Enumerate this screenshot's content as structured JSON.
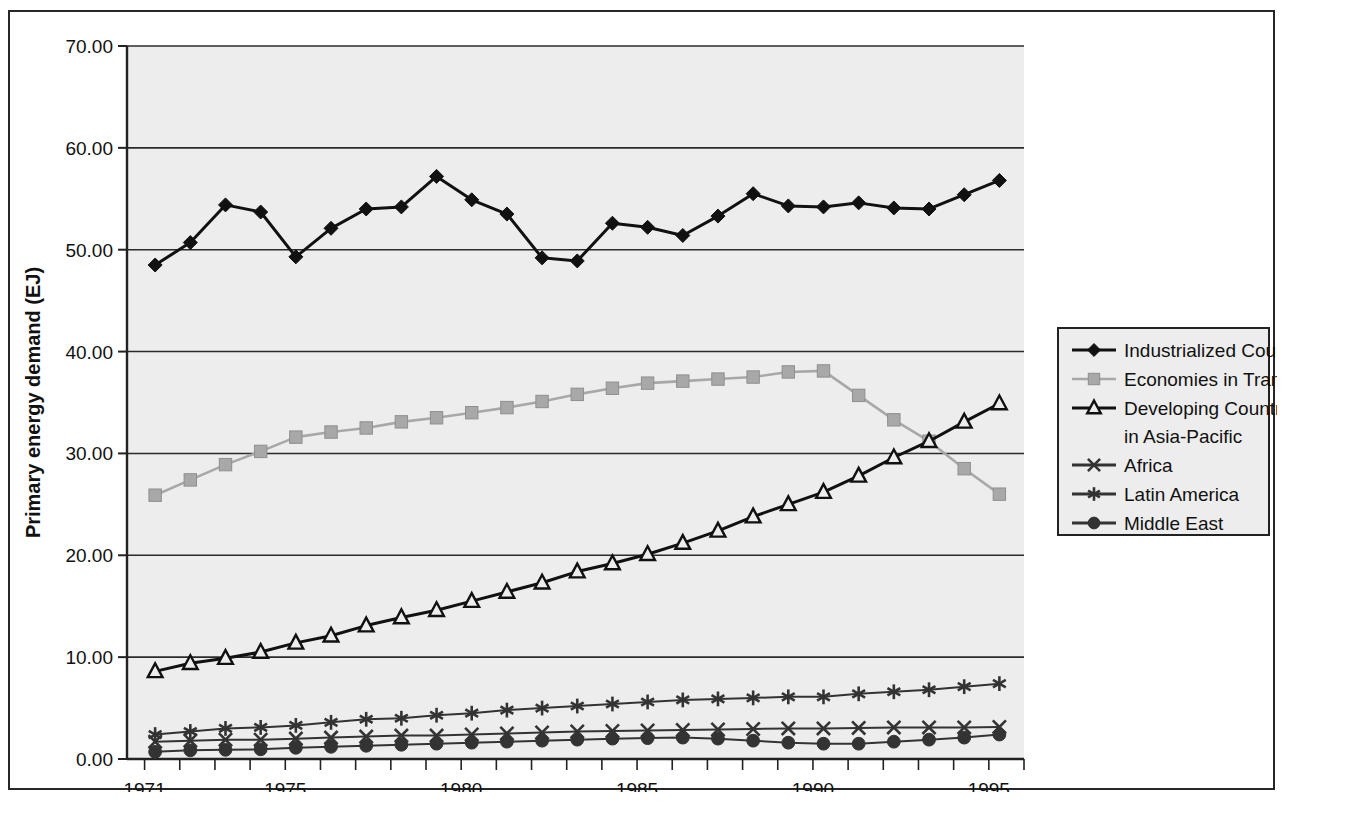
{
  "chart_data": {
    "type": "line",
    "title": "",
    "xlabel": "",
    "ylabel": "Primary energy demand (EJ)",
    "xlim": [
      1970.5,
      1996.0
    ],
    "ylim": [
      0,
      70
    ],
    "ytick_labels": [
      "0.00",
      "10.00",
      "20.00",
      "30.00",
      "40.00",
      "50.00",
      "60.00",
      "70.00"
    ],
    "ytick_values": [
      0,
      10,
      20,
      30,
      40,
      50,
      60,
      70
    ],
    "xtick_labels": [
      "1971",
      "1975",
      "1980",
      "1985",
      "1990",
      "1995"
    ],
    "xtick_values": [
      1971,
      1975,
      1980,
      1985,
      1990,
      1995
    ],
    "x_minor_ticks_every": 1,
    "grid": "horizontal",
    "legend_position": "right-outside",
    "plot_background": "#ededed",
    "x": [
      1971.3,
      1972.3,
      1973.3,
      1974.3,
      1975.3,
      1976.3,
      1977.3,
      1978.3,
      1979.3,
      1980.3,
      1981.3,
      1982.3,
      1983.3,
      1984.3,
      1985.3,
      1986.3,
      1987.3,
      1988.3,
      1989.3,
      1990.3,
      1991.3,
      1992.3,
      1993.3,
      1994.3,
      1995.3
    ],
    "series": [
      {
        "name": "Industrialized Countries",
        "marker": "filled-diamond",
        "color": "#111111",
        "values": [
          48.5,
          50.7,
          54.4,
          53.7,
          49.3,
          52.1,
          54.0,
          54.2,
          57.2,
          54.9,
          53.5,
          49.2,
          48.9,
          52.6,
          52.2,
          51.4,
          53.3,
          55.5,
          54.3,
          54.2,
          54.6,
          54.1,
          54.0,
          55.4,
          56.8
        ]
      },
      {
        "name": "Economies in Transition",
        "marker": "filled-square",
        "color": "#a8a8a8",
        "values": [
          25.9,
          27.4,
          28.9,
          30.2,
          31.6,
          32.1,
          32.5,
          33.1,
          33.5,
          34.0,
          34.5,
          35.1,
          35.8,
          36.4,
          36.9,
          37.1,
          37.3,
          37.5,
          38.0,
          38.1,
          35.7,
          33.3,
          31.2,
          28.5,
          26.0
        ]
      },
      {
        "name": "Developing Countries in Asia-Pacific",
        "marker": "open-triangle",
        "color": "#111111",
        "values": [
          8.6,
          9.4,
          9.9,
          10.5,
          11.4,
          12.1,
          13.1,
          13.9,
          14.6,
          15.5,
          16.4,
          17.3,
          18.4,
          19.2,
          20.1,
          21.2,
          22.4,
          23.8,
          25.0,
          26.2,
          27.8,
          29.6,
          31.2,
          33.1,
          34.9
        ]
      },
      {
        "name": "Africa",
        "marker": "cross-x",
        "color": "#333333",
        "values": [
          1.7,
          1.8,
          1.9,
          1.9,
          2.0,
          2.1,
          2.2,
          2.3,
          2.3,
          2.4,
          2.5,
          2.6,
          2.7,
          2.75,
          2.8,
          2.85,
          2.9,
          2.95,
          3.0,
          3.0,
          3.05,
          3.1,
          3.1,
          3.1,
          3.15
        ]
      },
      {
        "name": "Latin America",
        "marker": "asterisk",
        "color": "#333333",
        "values": [
          2.4,
          2.7,
          3.0,
          3.1,
          3.3,
          3.6,
          3.9,
          4.0,
          4.3,
          4.5,
          4.8,
          5.0,
          5.2,
          5.4,
          5.6,
          5.8,
          5.9,
          6.0,
          6.1,
          6.1,
          6.4,
          6.6,
          6.8,
          7.1,
          7.4
        ]
      },
      {
        "name": "Middle East",
        "marker": "filled-circle",
        "color": "#333333",
        "values": [
          0.7,
          0.85,
          0.9,
          0.95,
          1.1,
          1.2,
          1.3,
          1.4,
          1.5,
          1.6,
          1.7,
          1.8,
          1.9,
          2.0,
          2.05,
          2.1,
          2.0,
          1.8,
          1.6,
          1.5,
          1.5,
          1.7,
          1.9,
          2.1,
          2.4
        ]
      }
    ]
  },
  "legend": {
    "entries": [
      {
        "label": "Industrialized Countries"
      },
      {
        "label": "Economies in Transition"
      },
      {
        "label": "Developing Countries"
      },
      {
        "label": "in Asia-Pacific"
      },
      {
        "label": "Africa"
      },
      {
        "label": "Latin America"
      },
      {
        "label": "Middle East"
      }
    ]
  },
  "colors": {
    "plot_bg": "#ededed",
    "frame": "#262626",
    "gridline": "#2b2b2b",
    "series_dark": "#111111",
    "series_gray": "#a8a8a8"
  }
}
